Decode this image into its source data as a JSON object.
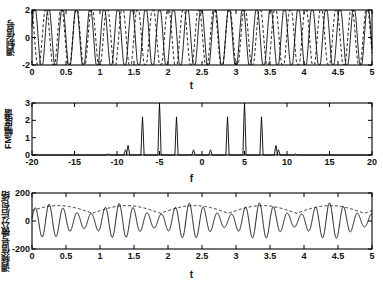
{
  "figure": {
    "background": "#ffffff",
    "axis_color": "#000000",
    "line_color": "#000000",
    "width": 383,
    "height": 286
  },
  "chart_data": [
    {
      "type": "line",
      "id": "subplot-1",
      "title": "",
      "xlabel": "t",
      "ylabel": "调制信号",
      "xlim": [
        0,
        5
      ],
      "ylim": [
        -2,
        2
      ],
      "xticks": [
        0,
        0.5,
        1,
        1.5,
        2,
        2.5,
        3,
        3.5,
        4,
        4.5,
        5
      ],
      "xticklabels": [
        "0",
        "0.5",
        "1",
        "1.5",
        "2",
        "2.5",
        "3",
        "3.5",
        "4",
        "4.5",
        "5"
      ],
      "yticks": [
        -2,
        0,
        2
      ],
      "yticklabels": [
        "-2",
        "0",
        "2"
      ],
      "grid": false,
      "legend": null,
      "series": [
        {
          "name": "调制信号 (solid)",
          "style": "solid",
          "color": "#000000",
          "waveform": "sine",
          "amplitude": 1.9,
          "frequency": 5.0,
          "phase": 0
        },
        {
          "name": "载波 (dashed)",
          "style": "dashed",
          "color": "#000000",
          "waveform": "sine",
          "amplitude": 1.9,
          "frequency": 4.6,
          "phase": 1.2
        }
      ]
    },
    {
      "type": "line",
      "id": "subplot-2",
      "title": "",
      "xlabel": "f",
      "ylabel": "FM幅度谱",
      "xlim": [
        -20,
        20
      ],
      "ylim": [
        0,
        3
      ],
      "xticks": [
        -20,
        -15,
        -10,
        -5,
        0,
        5,
        10,
        15,
        20
      ],
      "xticklabels": [
        "-20",
        "-15",
        "-10",
        "-5",
        "0",
        "5",
        "10",
        "15",
        "20"
      ],
      "yticks": [
        0,
        1,
        2,
        3
      ],
      "yticklabels": [
        "0",
        "1",
        "2",
        "3"
      ],
      "grid": false,
      "legend": null,
      "spikes": [
        {
          "f": -11,
          "amp": 0.06
        },
        {
          "f": -9,
          "amp": 0.3
        },
        {
          "f": -8.7,
          "amp": 0.55
        },
        {
          "f": -7,
          "amp": 2.2
        },
        {
          "f": -5,
          "amp": 3.0
        },
        {
          "f": -3,
          "amp": 2.2
        },
        {
          "f": -1,
          "amp": 0.3
        },
        {
          "f": 1,
          "amp": 0.3
        },
        {
          "f": 3,
          "amp": 2.2
        },
        {
          "f": 5,
          "amp": 3.0
        },
        {
          "f": 7,
          "amp": 2.2
        },
        {
          "f": 8.7,
          "amp": 0.55
        },
        {
          "f": 9,
          "amp": 0.3
        },
        {
          "f": 11,
          "amp": 0.06
        }
      ]
    },
    {
      "type": "line",
      "id": "subplot-3",
      "title": "",
      "xlabel": "t",
      "ylabel": "调频信号微分后包络",
      "xlim": [
        0,
        5
      ],
      "ylim": [
        -200,
        200
      ],
      "xticks": [
        0,
        0.5,
        1,
        1.5,
        2,
        2.5,
        3,
        3.5,
        4,
        4.5,
        5
      ],
      "xticklabels": [
        "0",
        "0.5",
        "1",
        "1.5",
        "2",
        "2.5",
        "3",
        "3.5",
        "4",
        "4.5",
        "5"
      ],
      "yticks": [
        -200,
        0,
        200
      ],
      "yticklabels": [
        "-200",
        "0",
        "200"
      ],
      "grid": false,
      "legend": null,
      "series": [
        {
          "name": "微分后信号 (solid)",
          "style": "solid",
          "color": "#000000",
          "waveform": "am-modulated",
          "carrier_frequency": 5.0,
          "envelope_frequency": 1.0,
          "amplitude": 120
        },
        {
          "name": "包络 (dashed)",
          "style": "dashed",
          "color": "#000000",
          "waveform": "envelope",
          "envelope_frequency": 1.0,
          "amplitude": 105
        }
      ]
    }
  ]
}
